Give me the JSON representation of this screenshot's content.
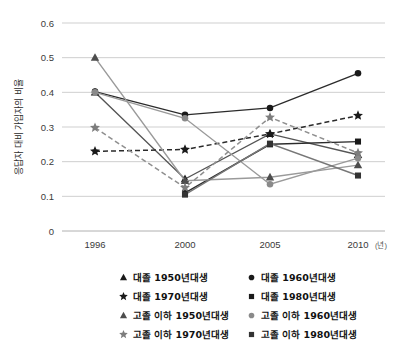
{
  "chart_data": {
    "type": "line",
    "title": "",
    "xlabel": "",
    "ylabel": "응답자 대비 가입자의 비율",
    "x_unit": "(년)",
    "categories": [
      "1996",
      "2000",
      "2005",
      "2010"
    ],
    "ylim": [
      0,
      0.6
    ],
    "ytick_labels": [
      "0",
      "0.1",
      "0.2",
      "0.3",
      "0.4",
      "0.5",
      "0.6"
    ],
    "ytick_values": [
      0,
      0.1,
      0.2,
      0.3,
      0.4,
      0.5,
      0.6
    ],
    "grid": true,
    "legend_position": "bottom",
    "series": [
      {
        "name": "대졸 1950년대생",
        "marker": "triangle",
        "color": "#1a1a1a",
        "line_style": "solid",
        "line_color": "#555555",
        "values": [
          0.4,
          0.15,
          0.28,
          0.22
        ]
      },
      {
        "name": "대졸 1960년대생",
        "marker": "circle",
        "color": "#1a1a1a",
        "line_style": "solid",
        "line_color": "#2b2b2b",
        "values": [
          0.402,
          0.335,
          0.355,
          0.455
        ]
      },
      {
        "name": "대졸 1970년대생",
        "marker": "star",
        "color": "#1a1a1a",
        "line_style": "dashed",
        "line_color": "#2b2b2b",
        "values": [
          0.23,
          0.235,
          0.28,
          0.333
        ]
      },
      {
        "name": "대졸 1980년대생",
        "marker": "square",
        "color": "#1a1a1a",
        "line_style": "solid",
        "line_color": "#2b2b2b",
        "values": [
          null,
          0.11,
          0.25,
          0.258
        ]
      },
      {
        "name": "고졸 이하 1950년대생",
        "marker": "triangle",
        "color": "#4d4d4d",
        "line_style": "solid",
        "line_color": "#9a9a9a",
        "values": [
          0.5,
          0.145,
          0.155,
          0.19
        ]
      },
      {
        "name": "고졸 이하 1960년대생",
        "marker": "circle",
        "color": "#8a8a8a",
        "line_style": "solid",
        "line_color": "#9a9a9a",
        "values": [
          0.4,
          0.325,
          0.135,
          0.21
        ]
      },
      {
        "name": "고졸 이하 1970년대생",
        "marker": "star",
        "color": "#7d7d7d",
        "line_style": "dashed",
        "line_color": "#8f8f8f",
        "values": [
          0.298,
          0.125,
          0.328,
          0.225
        ]
      },
      {
        "name": "고졸 이하 1980년대생",
        "marker": "square",
        "color": "#333333",
        "line_style": "solid",
        "line_color": "#777777",
        "values": [
          null,
          0.105,
          0.252,
          0.16
        ]
      }
    ]
  },
  "legend": {
    "entries": [
      {
        "label": "대졸 1950년대생",
        "marker": "triangle",
        "color": "#1a1a1a"
      },
      {
        "label": "대졸 1960년대생",
        "marker": "circle",
        "color": "#1a1a1a"
      },
      {
        "label": "대졸 1970년대생",
        "marker": "star",
        "color": "#1a1a1a"
      },
      {
        "label": "대졸 1980년대생",
        "marker": "square",
        "color": "#1a1a1a"
      },
      {
        "label": "고졸 이하 1950년대생",
        "marker": "triangle",
        "color": "#4d4d4d"
      },
      {
        "label": "고졸 이하 1960년대생",
        "marker": "circle",
        "color": "#8a8a8a"
      },
      {
        "label": "고졸 이하 1970년대생",
        "marker": "star",
        "color": "#7d7d7d"
      },
      {
        "label": "고졸 이하 1980년대생",
        "marker": "square",
        "color": "#333333"
      }
    ]
  }
}
